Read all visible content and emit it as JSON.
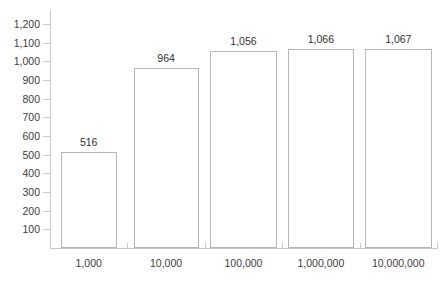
{
  "chart_data": {
    "type": "bar",
    "title": "",
    "subtitle": "",
    "xlabel": "",
    "ylabel": "",
    "categories": [
      "1,000",
      "10,000",
      "100,000",
      "1,000,000",
      "10,000,000"
    ],
    "values": [
      516,
      964,
      1056,
      1066,
      1067
    ],
    "value_labels": [
      "516",
      "964",
      "1,056",
      "1,066",
      "1,067"
    ],
    "ylim": [
      0,
      1200
    ],
    "ytick_values": [
      100,
      200,
      300,
      400,
      500,
      600,
      700,
      800,
      900,
      1000,
      1100,
      1200
    ],
    "ytick_labels": [
      "100",
      "200",
      "300",
      "400",
      "500",
      "600",
      "700",
      "800",
      "900",
      "1,000",
      "1,100",
      "1,200"
    ],
    "grid": false,
    "legend": null,
    "series": [
      {
        "name": "",
        "values": [
          516,
          964,
          1056,
          1066,
          1067
        ]
      }
    ],
    "annotations": [],
    "colors": {
      "bar_fill": "#ffffff",
      "bar_border": "#b5b5b5",
      "axis_line": "#c9c9c9",
      "tick_text": "#3c3c3c",
      "value_text": "#2f2f2f",
      "background": "#ffffff"
    }
  }
}
